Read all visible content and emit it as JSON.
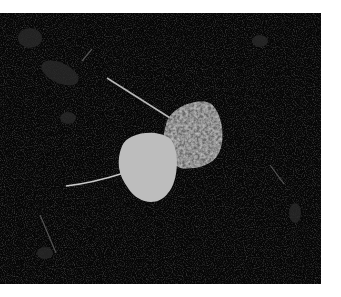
{
  "image": {
    "description": "Black-and-white photograph of two round aspen-like leaves on dark soil",
    "border_color": "#ffffff",
    "background_color": "#060606",
    "subjects": [
      {
        "name": "light-leaf",
        "fill": "#bdbdbd"
      },
      {
        "name": "dark-leaf",
        "fill": "#6a6a6a"
      }
    ]
  }
}
